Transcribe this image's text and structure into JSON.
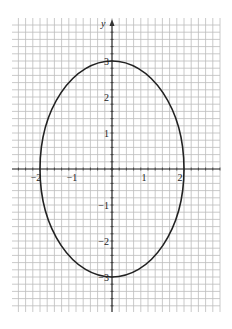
{
  "chart_data": {
    "type": "line",
    "title": "",
    "xlabel": "",
    "ylabel": "y",
    "curve": "ellipse",
    "equation_implied": "x^2/4 + y^2/9 = 1",
    "center": [
      0,
      0
    ],
    "semi_axis_x": 2,
    "semi_axis_y": 3,
    "xlim": [
      -2.8,
      3
    ],
    "ylim": [
      -4.0,
      4.2
    ],
    "grid": true,
    "grid_minor_step": 0.2,
    "x_ticks": [
      -2,
      -1,
      1,
      2
    ],
    "x_tick_labels": [
      "−2",
      "−1",
      "1",
      "2"
    ],
    "y_ticks": [
      3,
      2,
      1,
      -1,
      -2,
      -3
    ],
    "y_tick_labels": [
      "3",
      "2",
      "1",
      "−1",
      "−2",
      "−3"
    ],
    "key_points": [
      [
        2,
        0
      ],
      [
        -2,
        0
      ],
      [
        0,
        3
      ],
      [
        0,
        -3
      ]
    ],
    "colors": {
      "curve": "#222222",
      "grid": "#bdbdbd",
      "axis": "#333333"
    }
  }
}
